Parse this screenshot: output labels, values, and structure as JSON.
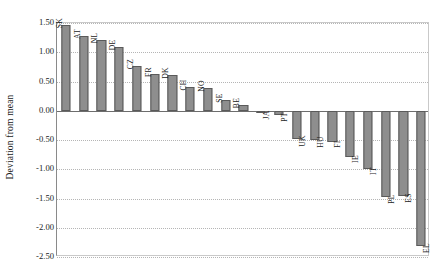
{
  "chart_data": {
    "type": "bar",
    "title": "",
    "xlabel": "",
    "ylabel": "Deviation from mean",
    "ylim": [
      -2.5,
      1.5
    ],
    "grid": true,
    "legend": "none",
    "orientation": "vertical",
    "categories": [
      "SK",
      "AT",
      "NL",
      "DE",
      "CZ",
      "FR",
      "DK",
      "CH",
      "NO",
      "SE",
      "BE",
      "JA",
      "PT",
      "UK",
      "HU",
      "FI",
      "IE",
      "IT",
      "PL",
      "ES",
      "EL"
    ],
    "values": [
      1.47,
      1.27,
      1.21,
      1.09,
      0.76,
      0.63,
      0.61,
      0.41,
      0.39,
      0.18,
      0.1,
      -0.04,
      -0.08,
      -0.49,
      -0.5,
      -0.53,
      -0.79,
      -1.0,
      -1.47,
      -1.45,
      -2.31
    ],
    "ytick_labels": [
      "1.50",
      "1.00",
      "0.50",
      "0.00",
      "-0.50",
      "-1.00",
      "-1.50",
      "-2.00",
      "-2.50"
    ],
    "ytick_values": [
      1.5,
      1.0,
      0.5,
      0.0,
      -0.5,
      -1.0,
      -1.5,
      -2.0,
      -2.5
    ],
    "bar_color": "#8e8e8e",
    "bar_edge_color": "#5a5a5a",
    "gridline_color": "#b5b5b5",
    "axis_color": "#6d6d6d"
  }
}
